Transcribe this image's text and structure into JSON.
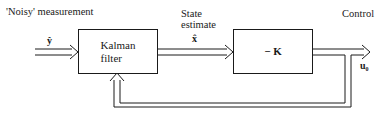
{
  "diagram": {
    "labels": {
      "noisy_measurement": "'Noisy' measurement",
      "state_estimate_line1": "State",
      "state_estimate_line2": "estimate",
      "control": "Control"
    },
    "signals": {
      "measurement": "ŷ",
      "state": "x̂",
      "control_output": "u₀"
    },
    "blocks": {
      "kalman_line1": "Kalman",
      "kalman_line2": "filter",
      "gain": "− K"
    },
    "colors": {
      "line": "#1a1a1a",
      "background": "#ffffff"
    }
  }
}
